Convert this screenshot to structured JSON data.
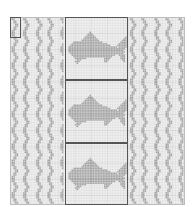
{
  "chart": {
    "title": "",
    "cols": 108,
    "rows": 116,
    "cell_px": 1.62,
    "colors": {
      "background": "#ffffff",
      "grid_line": "#d4d4d4",
      "grid_major": "#bdbdbd",
      "filled_cell": "#8a8a8a",
      "outline": "#555555"
    },
    "sections": {
      "left_wave": {
        "col_start": 0,
        "col_end": 34
      },
      "center_panel": {
        "col_start": 34,
        "col_end": 73
      },
      "right_wave": {
        "col_start": 73,
        "col_end": 108
      }
    },
    "repeat_box": {
      "col": 0,
      "row": 0,
      "w": 7,
      "h": 13
    },
    "fish_panels": [
      {
        "row_start": 0,
        "row_end": 39
      },
      {
        "row_start": 39,
        "row_end": 78
      },
      {
        "row_start": 78,
        "row_end": 116
      }
    ],
    "fish_motif": [
      "..............#.......................",
      ".............###......................",
      "............#####.....................",
      "...........#######..................#.",
      "..........#########................##.",
      ".........###########..............###.",
      "....##################...........####.",
      "...######################.......#####.",
      "..#########################....######.",
      ".##############################.#####.",
      ".###################################..",
      ".##################################...",
      ".###################################..",
      "..#################################...",
      "...###########################..####..",
      "....########################.....###..",
      ".....#######...........####......###..",
      "......###..............###........##..",
      ".....###...............##..........#..",
      "......#..............................."
    ],
    "wave_motif": [
      "##.....##......",
      "##.....##......",
      ".##.....##.....",
      ".##.....##.....",
      "..##.....##....",
      "..##.....##....",
      ".##.....##.....",
      ".##.....##.....",
      "##.....##......",
      "##.....##......"
    ]
  }
}
